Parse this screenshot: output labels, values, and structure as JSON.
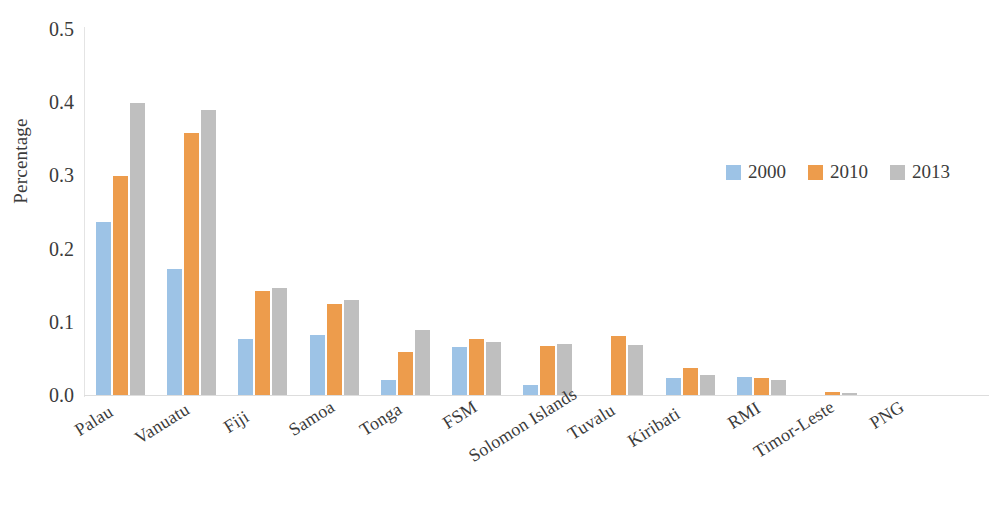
{
  "chart_data": {
    "type": "bar",
    "title": "",
    "xlabel": "",
    "ylabel": "Percentage",
    "ylim": [
      0,
      0.5
    ],
    "ytick_labels": [
      "0.5",
      "0.4",
      "0.3",
      "0.2",
      "0.1",
      "0.0"
    ],
    "ytick_values": [
      0.5,
      0.4,
      0.3,
      0.2,
      0.1,
      0.0
    ],
    "grid": false,
    "legend_position": "upper-right-inside",
    "categories": [
      "Palau",
      "Vanuatu",
      "Fiji",
      "Samoa",
      "Tonga",
      "FSM",
      "Solomon Islands",
      "Tuvalu",
      "Kiribati",
      "RMI",
      "Timor-Leste",
      "PNG"
    ],
    "series": [
      {
        "name": "2000",
        "color": "#9dc3e6",
        "values": [
          0.237,
          0.172,
          0.076,
          0.082,
          0.021,
          0.066,
          0.013,
          0.0,
          0.023,
          0.025,
          0.0,
          0.0
        ]
      },
      {
        "name": "2010",
        "color": "#ed9c4c",
        "values": [
          0.299,
          0.358,
          0.142,
          0.125,
          0.059,
          0.077,
          0.067,
          0.08,
          0.037,
          0.023,
          0.004,
          0.0
        ]
      },
      {
        "name": "2013",
        "color": "#bfbfbf",
        "values": [
          0.399,
          0.39,
          0.146,
          0.13,
          0.089,
          0.073,
          0.07,
          0.069,
          0.028,
          0.02,
          0.003,
          0.0
        ]
      }
    ]
  },
  "legend": {
    "items": [
      {
        "label": "2000",
        "color": "#9dc3e6"
      },
      {
        "label": "2010",
        "color": "#ed9c4c"
      },
      {
        "label": "2013",
        "color": "#bfbfbf"
      }
    ]
  }
}
